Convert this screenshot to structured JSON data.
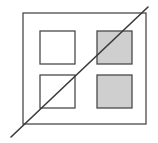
{
  "diagram": {
    "colors": {
      "background": "#ffffff",
      "stroke": "#4a4a4a",
      "white_fill": "#ffffff",
      "gray_fill": "#cfcfcf"
    },
    "outer_square": {
      "x": 23,
      "y": 13,
      "w": 123,
      "h": 111
    },
    "inner_squares": [
      {
        "id": "top-left",
        "x": 40,
        "y": 31,
        "w": 35,
        "h": 33,
        "fill": "white"
      },
      {
        "id": "top-right",
        "x": 97,
        "y": 31,
        "w": 35,
        "h": 33,
        "fill": "gray"
      },
      {
        "id": "bottom-left",
        "x": 40,
        "y": 75,
        "w": 35,
        "h": 33,
        "fill": "white"
      },
      {
        "id": "bottom-right",
        "x": 97,
        "y": 75,
        "w": 35,
        "h": 33,
        "fill": "gray"
      }
    ],
    "diagonal_line": {
      "x1": 11,
      "y1": 137,
      "x2": 148,
      "y2": 7
    }
  }
}
